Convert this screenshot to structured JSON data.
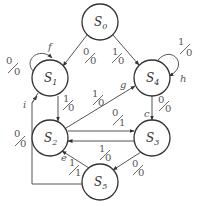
{
  "diagram": {
    "type": "state-machine",
    "nodes": [
      {
        "id": "S0",
        "base": "S",
        "sub": "0",
        "cx": 100,
        "cy": 22
      },
      {
        "id": "S1",
        "base": "S",
        "sub": "1",
        "cx": 50,
        "cy": 78
      },
      {
        "id": "S4",
        "base": "S",
        "sub": "4",
        "cx": 152,
        "cy": 78
      },
      {
        "id": "S2",
        "base": "S",
        "sub": "2",
        "cx": 50,
        "cy": 138
      },
      {
        "id": "S3",
        "base": "S",
        "sub": "3",
        "cx": 152,
        "cy": 138
      },
      {
        "id": "S5",
        "base": "S",
        "sub": "5",
        "cx": 100,
        "cy": 182
      }
    ],
    "edges": [
      {
        "from": "S0",
        "to": "S1",
        "input": "0",
        "output": "0",
        "name": ""
      },
      {
        "from": "S0",
        "to": "S4",
        "input": "1",
        "output": "0",
        "name": ""
      },
      {
        "from": "S1",
        "to": "S1",
        "input": "0",
        "output": "0",
        "name": "f"
      },
      {
        "from": "S4",
        "to": "S4",
        "input": "1",
        "output": "0",
        "name": "h"
      },
      {
        "from": "S1",
        "to": "S2",
        "input": "1",
        "output": "0",
        "name": ""
      },
      {
        "from": "S2",
        "to": "S4",
        "input": "1",
        "output": "0",
        "name": "g"
      },
      {
        "from": "S4",
        "to": "S3",
        "input": "0",
        "output": "0",
        "name": "c"
      },
      {
        "from": "S2",
        "to": "S3",
        "input": "0",
        "output": "1",
        "name": ""
      },
      {
        "from": "S3",
        "to": "S2",
        "input": "1",
        "output": "0",
        "name": ""
      },
      {
        "from": "S3",
        "to": "S5",
        "input": "0",
        "output": "0",
        "name": ""
      },
      {
        "from": "S5",
        "to": "S2",
        "input": "1",
        "output": "1",
        "name": "e"
      },
      {
        "from": "S5",
        "to": "S1",
        "input": "0",
        "output": "0",
        "name": "i"
      }
    ]
  },
  "labels": {
    "s0": {
      "base": "S",
      "sub": "0"
    },
    "s1": {
      "base": "S",
      "sub": "1"
    },
    "s2": {
      "base": "S",
      "sub": "2"
    },
    "s3": {
      "base": "S",
      "sub": "3"
    },
    "s4": {
      "base": "S",
      "sub": "4"
    },
    "s5": {
      "base": "S",
      "sub": "5"
    },
    "e_s0_s1": {
      "in": "0",
      "out": "0"
    },
    "e_s0_s4": {
      "in": "1",
      "out": "0"
    },
    "e_s1_loop": {
      "in": "0",
      "out": "0",
      "name": "f"
    },
    "e_s4_loop": {
      "in": "1",
      "out": "0",
      "name": "h"
    },
    "e_s1_s2": {
      "in": "1",
      "out": "0"
    },
    "e_s2_s4": {
      "in": "1",
      "out": "0",
      "name": "g"
    },
    "e_s4_s3": {
      "in": "0",
      "out": "0",
      "name": "c"
    },
    "e_s2_s3": {
      "in": "0",
      "out": "1"
    },
    "e_s3_s2": {
      "in": "1",
      "out": "0"
    },
    "e_s3_s5": {
      "in": "0",
      "out": "0"
    },
    "e_s5_s2": {
      "in": "1",
      "out": "1",
      "name": "e"
    },
    "e_s5_s1": {
      "in": "0",
      "out": "0",
      "name": "i"
    }
  }
}
